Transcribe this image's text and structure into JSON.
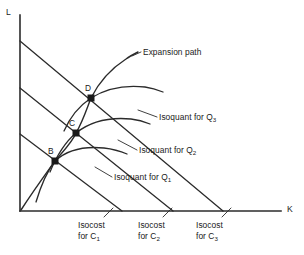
{
  "figure": {
    "type": "economics-diagram",
    "title_visible": false,
    "background_color": "#ffffff",
    "ink_color": "#2b2b2b"
  },
  "axes": {
    "vertical": {
      "label": "L",
      "name": "labor-axis",
      "x": 20,
      "y_top": 15,
      "y_bottom": 211
    },
    "horizontal": {
      "label": "K",
      "name": "capital-axis",
      "y": 211,
      "x_left": 20,
      "x_right": 281
    }
  },
  "axis_labels": {
    "l_label": "L",
    "k_label": "K"
  },
  "points": [
    {
      "label": "B",
      "x": 55,
      "y": 161
    },
    {
      "label": "C",
      "x": 76,
      "y": 133
    },
    {
      "label": "D",
      "x": 91,
      "y": 98
    }
  ],
  "isocosts": [
    {
      "id": "C1",
      "label_line1": "Isocost",
      "label_line2_prefix": "for C",
      "label_line2_sub": "1",
      "l_intercept_y": 134,
      "k_intercept_x": 122,
      "label_x": 78,
      "label_y": 226,
      "leader_from_x": 104,
      "leader_from_y": 217,
      "leader_to_x": 113,
      "leader_to_y": 208
    },
    {
      "id": "C2",
      "label_line1": "Isocost",
      "label_line2_prefix": "for C",
      "label_line2_sub": "2",
      "l_intercept_y": 88,
      "k_intercept_x": 173,
      "label_x": 138,
      "label_y": 226,
      "leader_from_x": 163,
      "leader_from_y": 217,
      "leader_to_x": 172,
      "leader_to_y": 208
    },
    {
      "id": "C3",
      "label_line1": "Isocost",
      "label_line2_prefix": "for C",
      "label_line2_sub": "3",
      "l_intercept_y": 41,
      "k_intercept_x": 223,
      "label_x": 196,
      "label_y": 226,
      "leader_from_x": 222,
      "leader_from_y": 217,
      "leader_to_x": 231,
      "leader_to_y": 208
    }
  ],
  "isoquants": [
    {
      "id": "Q1",
      "label_prefix": "Isoquant for Q",
      "label_sub": "1",
      "label_x": 114,
      "label_y": 180,
      "path": "M 36,202 C 42,182 48,170 55,161 C 68,149 84,146 104,148 C 113,149 120,151 127,154",
      "leader_from_x": 112,
      "leader_from_y": 177,
      "leader_to_x": 95,
      "leader_to_y": 167
    },
    {
      "id": "Q2",
      "label_prefix": "Isoquant for Q",
      "label_sub": "2",
      "label_x": 139,
      "label_y": 153,
      "path": "M 50,172 C 57,155 64,143 76,133 C 91,121 110,117 131,119 C 139,120 145,122 150,124",
      "leader_from_x": 137,
      "leader_from_y": 150,
      "leader_to_x": 118,
      "leader_to_y": 140
    },
    {
      "id": "Q3",
      "label_prefix": "Isoquant for Q",
      "label_sub": "3",
      "label_x": 159,
      "label_y": 120,
      "path": "M 64,131 C 71,115 79,106 91,98 C 107,88 127,85 145,87 C 152,88 158,90 163,92",
      "leader_from_x": 157,
      "leader_from_y": 117,
      "leader_to_x": 138,
      "leader_to_y": 110
    }
  ],
  "expansion_path": {
    "label": "Expansion path",
    "label_x": 143,
    "label_y": 55,
    "path": "M 21,210 C 34,190 45,175 55,161 C 66,148 73,141 76,133 C 83,121 87,108 91,98 C 99,82 112,68 126,59 C 130,56 134,54 138,52",
    "leader_from_x": 141,
    "leader_from_y": 52,
    "leader_to_x": 132,
    "leader_to_y": 56
  }
}
